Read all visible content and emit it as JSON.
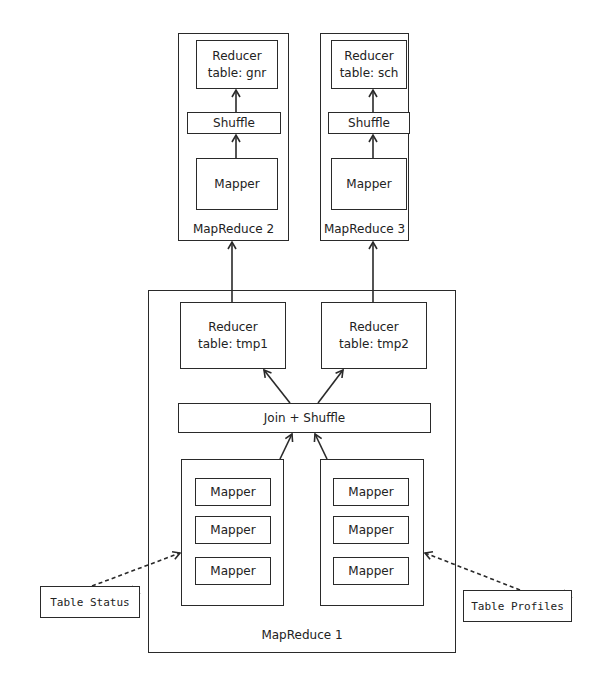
{
  "diagram": {
    "mapreduce2": {
      "label": "MapReduce 2",
      "reducer": {
        "title": "Reducer",
        "table": "table: gnr"
      },
      "shuffle": "Shuffle",
      "mapper": "Mapper"
    },
    "mapreduce3": {
      "label": "MapReduce 3",
      "reducer": {
        "title": "Reducer",
        "table": "table: sch"
      },
      "shuffle": "Shuffle",
      "mapper": "Mapper"
    },
    "mapreduce1": {
      "label": "MapReduce 1",
      "reducer_left": {
        "title": "Reducer",
        "table": "table: tmp1"
      },
      "reducer_right": {
        "title": "Reducer",
        "table": "table: tmp2"
      },
      "join_shuffle": "Join + Shuffle",
      "left_mappers": [
        "Mapper",
        "Mapper",
        "Mapper"
      ],
      "right_mappers": [
        "Mapper",
        "Mapper",
        "Mapper"
      ]
    },
    "inputs": {
      "left": "Table Status",
      "right": "Table Profiles"
    },
    "colors": {
      "line": "#2a2a2a",
      "background": "#ffffff"
    }
  }
}
